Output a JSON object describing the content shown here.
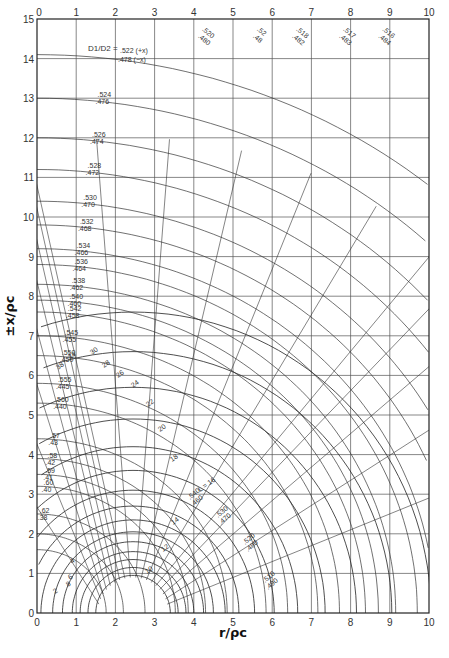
{
  "chart_data": {
    "type": "line",
    "title": "",
    "xlabel": "r/ρc",
    "ylabel": "±x/ρc",
    "xlim": [
      0,
      10
    ],
    "ylim": [
      0,
      15
    ],
    "grid": true,
    "x_ticks_bottom": [
      "0",
      "1",
      "2",
      "3",
      "4",
      "5",
      "6",
      "7",
      "8",
      "9",
      "10"
    ],
    "x_ticks_top": [
      "0",
      "1",
      "2",
      "3",
      "4",
      "5",
      "6",
      "7",
      "8",
      "9",
      "10"
    ],
    "y_ticks": [
      "0",
      "1",
      "2",
      "3",
      "4",
      "5",
      "6",
      "7",
      "8",
      "9",
      "10",
      "11",
      "12",
      "13",
      "14",
      "15"
    ],
    "header_annotation": {
      "label": "D1/D2 =",
      "plus_x": ".522 (+x)",
      "minus_x": ".478 (−x)"
    },
    "ratio_curves_left": [
      {
        "top": ".522",
        "bottom": ".478",
        "y": 14.1
      },
      {
        "top": ".524",
        "bottom": ".476",
        "y": 13.0
      },
      {
        "top": ".526",
        "bottom": ".474",
        "y": 12.0
      },
      {
        "top": ".528",
        "bottom": ".472",
        "y": 11.2
      },
      {
        "top": ".530",
        "bottom": ".470",
        "y": 10.4
      },
      {
        "top": ".532",
        "bottom": ".468",
        "y": 9.8
      },
      {
        "top": ".534",
        "bottom": ".466",
        "y": 9.2
      },
      {
        "top": ".536",
        "bottom": ".464",
        "y": 8.8
      },
      {
        "top": ".538",
        "bottom": ".462",
        "y": 8.3
      },
      {
        "top": ".540",
        "bottom": ".460",
        "y": 7.9
      },
      {
        "top": ".542",
        "bottom": ".458",
        "y": 7.6
      },
      {
        "top": ".545",
        "bottom": ".455",
        "y": 7.0
      },
      {
        "top": ".550",
        "bottom": ".450",
        "y": 6.5
      },
      {
        "top": ".555",
        "bottom": ".445",
        "y": 5.8
      },
      {
        "top": ".560",
        "bottom": ".440",
        "y": 5.3
      },
      {
        "top": ".57",
        "bottom": ".43",
        "y": 4.4
      },
      {
        "top": ".58",
        "bottom": ".42",
        "y": 3.9
      },
      {
        "top": ".59",
        "bottom": ".41",
        "y": 3.5
      },
      {
        "top": ".60",
        "bottom": ".40",
        "y": 3.2
      },
      {
        "top": ".62",
        "bottom": ".38",
        "y": 2.5
      }
    ],
    "ratio_curves_top": [
      {
        "top": ".520",
        "bottom": ".480",
        "x": 4.2
      },
      {
        "top": ".52",
        "bottom": ".48",
        "x": 5.6
      },
      {
        "top": ".518",
        "bottom": ".482",
        "x": 6.6
      },
      {
        "top": ".517",
        "bottom": ".483",
        "x": 7.8
      },
      {
        "top": ".516",
        "bottom": ".484",
        "x": 8.8
      }
    ],
    "ratio_curves_inner": [
      {
        "top": ".540",
        "bottom": ".460"
      },
      {
        "top": ".530",
        "bottom": ".470"
      },
      {
        "top": ".520",
        "bottom": ".480"
      },
      {
        "top": ".510",
        "bottom": ".490"
      }
    ],
    "L_curves": {
      "prefix": "L =",
      "values": [
        "38",
        "34",
        "30",
        "28",
        "26",
        "24",
        "22",
        "20",
        "18",
        "16",
        "14",
        "12",
        "10",
        "8",
        "6",
        "4",
        "2"
      ]
    }
  },
  "axes": {
    "x_title": "r/ρc",
    "y_title": "±x/ρc"
  }
}
